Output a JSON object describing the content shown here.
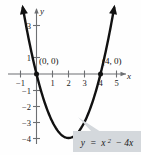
{
  "chart_data": {
    "type": "line",
    "title": "",
    "subtitle": "",
    "xlabel": "x",
    "ylabel": "y",
    "equation": "y = x² − 4x",
    "equation_parts": {
      "lhs": "y",
      "eq": "=",
      "base": "x",
      "exponent": "2",
      "tail": "− 4x"
    },
    "function": "y = x^2 - 4x",
    "xlim": [
      -1.5,
      5.7
    ],
    "ylim": [
      -4.8,
      3.9
    ],
    "xticks": [
      -1,
      1,
      2,
      3,
      4,
      5
    ],
    "xtick_labels": [
      "−1",
      "1",
      "2",
      "3",
      "4",
      "5"
    ],
    "yticks": [
      3,
      1,
      -1,
      -2,
      -3,
      -4
    ],
    "ytick_labels": [
      "3",
      "1",
      "−1",
      "−2",
      "−3",
      "−4"
    ],
    "grid": false,
    "legend": false,
    "series": [
      {
        "name": "y = x² − 4x",
        "color": "#111111",
        "x": [
          -0.85,
          -0.6,
          -0.3,
          0,
          0.4,
          0.8,
          1.2,
          1.6,
          2,
          2.4,
          2.8,
          3.2,
          3.6,
          4,
          4.4,
          4.8
        ],
        "y": [
          4.12,
          2.76,
          1.29,
          0,
          -1.44,
          -2.56,
          -3.36,
          -3.84,
          -4,
          -3.84,
          -3.36,
          -2.56,
          -1.44,
          0,
          1.76,
          3.84
        ]
      }
    ],
    "annotations": [
      {
        "name": "x-intercept-origin",
        "label": "(0, 0)",
        "x": 0,
        "y": 0,
        "marker": "dot"
      },
      {
        "name": "x-intercept-four",
        "label": "(4, 0)",
        "x": 4,
        "y": 0,
        "marker": "dot"
      }
    ],
    "callout": {
      "text": "y = x² − 4x",
      "fill": "#d4d8dc",
      "points_to": {
        "x": 2.6,
        "y": -2.7
      }
    },
    "axis_arrows": [
      "x-positive",
      "y-positive"
    ],
    "curve_arrows": [
      "left-branch-top",
      "right-branch-top"
    ]
  },
  "figure": {
    "background": "#fefefe",
    "axis_color": "#6d6f72",
    "curve_color": "#111111"
  }
}
